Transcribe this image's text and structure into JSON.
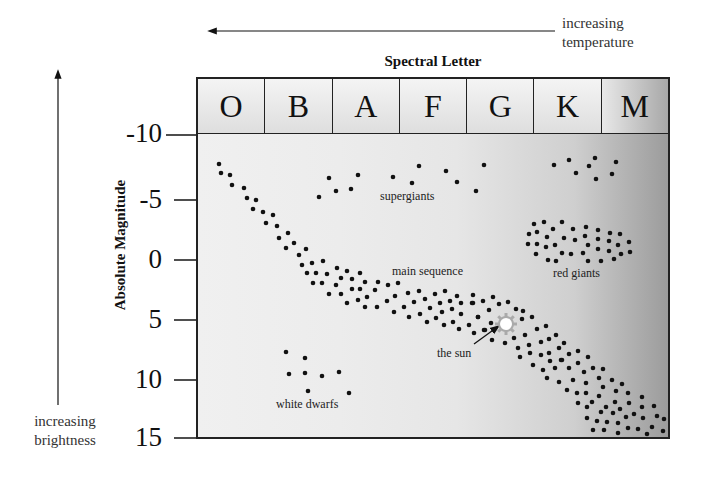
{
  "chart_data": {
    "type": "scatter",
    "xlabel": "Spectral Letter",
    "ylabel": "Absolute Magnitude",
    "x_categories": [
      "O",
      "B",
      "A",
      "F",
      "G",
      "K",
      "M"
    ],
    "y_ticks": [
      "-10",
      "-5",
      "0",
      "5",
      "10",
      "15"
    ],
    "y_tick_values": [
      -10,
      -5,
      0,
      5,
      10,
      15
    ],
    "ylim": [
      -10,
      15
    ],
    "y_inverted": true,
    "grid": false,
    "annotations": {
      "x_direction": "increasing temperature",
      "y_direction": "increasing brightness",
      "regions": [
        "supergiants",
        "red giants",
        "main sequence",
        "white dwarfs",
        "the sun"
      ]
    },
    "groups": [
      {
        "name": "supergiants",
        "points_px": [
          [
            319,
            197
          ],
          [
            329,
            178
          ],
          [
            336,
            191
          ],
          [
            351,
            189
          ],
          [
            358,
            175
          ],
          [
            393,
            177
          ],
          [
            412,
            183
          ],
          [
            419,
            166
          ],
          [
            446,
            171
          ],
          [
            457,
            182
          ],
          [
            476,
            191
          ],
          [
            484,
            165
          ],
          [
            554,
            165
          ],
          [
            569,
            160
          ],
          [
            576,
            173
          ],
          [
            589,
            166
          ],
          [
            595,
            158
          ],
          [
            596,
            179
          ],
          [
            612,
            174
          ],
          [
            616,
            162
          ]
        ]
      },
      {
        "name": "red giants",
        "points_px": [
          [
            534,
            224
          ],
          [
            544,
            222
          ],
          [
            562,
            222
          ],
          [
            553,
            229
          ],
          [
            529,
            234
          ],
          [
            537,
            232
          ],
          [
            547,
            237
          ],
          [
            573,
            229
          ],
          [
            586,
            227
          ],
          [
            598,
            230
          ],
          [
            610,
            233
          ],
          [
            620,
            234
          ],
          [
            564,
            238
          ],
          [
            575,
            240
          ],
          [
            585,
            236
          ],
          [
            598,
            239
          ],
          [
            609,
            241
          ],
          [
            629,
            242
          ],
          [
            528,
            244
          ],
          [
            537,
            244
          ],
          [
            546,
            247
          ],
          [
            555,
            245
          ],
          [
            588,
            245
          ],
          [
            598,
            249
          ],
          [
            609,
            251
          ],
          [
            618,
            245
          ],
          [
            630,
            252
          ],
          [
            536,
            254
          ],
          [
            562,
            253
          ],
          [
            571,
            254
          ],
          [
            583,
            253
          ],
          [
            621,
            254
          ],
          [
            548,
            260
          ],
          [
            556,
            261
          ],
          [
            588,
            261
          ],
          [
            601,
            261
          ],
          [
            614,
            259
          ]
        ]
      },
      {
        "name": "main sequence",
        "points_px": [
          [
            219,
            164
          ],
          [
            221,
            173
          ],
          [
            230,
            175
          ],
          [
            232,
            185
          ],
          [
            244,
            188
          ],
          [
            247,
            198
          ],
          [
            256,
            200
          ],
          [
            253,
            209
          ],
          [
            263,
            212
          ],
          [
            273,
            215
          ],
          [
            266,
            223
          ],
          [
            277,
            226
          ],
          [
            288,
            233
          ],
          [
            279,
            238
          ],
          [
            294,
            243
          ],
          [
            286,
            248
          ],
          [
            306,
            249
          ],
          [
            299,
            255
          ],
          [
            302,
            265
          ],
          [
            312,
            263
          ],
          [
            323,
            261
          ],
          [
            307,
            273
          ],
          [
            316,
            273
          ],
          [
            327,
            274
          ],
          [
            337,
            268
          ],
          [
            347,
            271
          ],
          [
            360,
            273
          ],
          [
            313,
            283
          ],
          [
            322,
            283
          ],
          [
            336,
            285
          ],
          [
            341,
            278
          ],
          [
            352,
            279
          ],
          [
            365,
            282
          ],
          [
            378,
            282
          ],
          [
            388,
            285
          ],
          [
            398,
            283
          ],
          [
            329,
            294
          ],
          [
            341,
            294
          ],
          [
            352,
            289
          ],
          [
            360,
            289
          ],
          [
            375,
            290
          ],
          [
            367,
            297
          ],
          [
            358,
            300
          ],
          [
            347,
            303
          ],
          [
            365,
            307
          ],
          [
            377,
            307
          ],
          [
            387,
            301
          ],
          [
            395,
            296
          ],
          [
            408,
            293
          ],
          [
            419,
            291
          ],
          [
            435,
            294
          ],
          [
            445,
            291
          ],
          [
            457,
            296
          ],
          [
            473,
            295
          ],
          [
            483,
            301
          ],
          [
            394,
            312
          ],
          [
            404,
            307
          ],
          [
            414,
            302
          ],
          [
            425,
            299
          ],
          [
            440,
            303
          ],
          [
            450,
            301
          ],
          [
            461,
            303
          ],
          [
            472,
            303
          ],
          [
            409,
            317
          ],
          [
            420,
            314
          ],
          [
            430,
            308
          ],
          [
            442,
            312
          ],
          [
            452,
            309
          ],
          [
            461,
            314
          ],
          [
            427,
            322
          ],
          [
            436,
            318
          ],
          [
            444,
            325
          ],
          [
            453,
            322
          ],
          [
            459,
            329
          ],
          [
            469,
            325
          ],
          [
            478,
            317
          ],
          [
            474,
            333
          ],
          [
            484,
            330
          ],
          [
            493,
            297
          ],
          [
            473,
            303
          ],
          [
            499,
            304
          ],
          [
            508,
            302
          ],
          [
            516,
            309
          ],
          [
            489,
            310
          ],
          [
            478,
            317
          ],
          [
            523,
            311
          ],
          [
            522,
            319
          ],
          [
            532,
            317
          ],
          [
            491,
            323
          ],
          [
            485,
            330
          ],
          [
            492,
            340
          ],
          [
            505,
            343
          ],
          [
            514,
            338
          ],
          [
            525,
            335
          ],
          [
            537,
            329
          ],
          [
            546,
            326
          ],
          [
            518,
            348
          ],
          [
            529,
            345
          ],
          [
            541,
            342
          ],
          [
            549,
            339
          ],
          [
            556,
            335
          ],
          [
            520,
            357
          ],
          [
            530,
            353
          ],
          [
            541,
            355
          ],
          [
            549,
            353
          ],
          [
            559,
            348
          ],
          [
            564,
            343
          ],
          [
            533,
            365
          ],
          [
            543,
            370
          ],
          [
            550,
            361
          ],
          [
            561,
            360
          ],
          [
            569,
            354
          ],
          [
            578,
            351
          ],
          [
            588,
            357
          ],
          [
            562,
            360
          ],
          [
            578,
            363
          ],
          [
            555,
            368
          ],
          [
            569,
            368
          ],
          [
            584,
            372
          ],
          [
            593,
            368
          ],
          [
            603,
            369
          ],
          [
            547,
            378
          ],
          [
            559,
            382
          ],
          [
            573,
            380
          ],
          [
            586,
            383
          ],
          [
            599,
            378
          ],
          [
            612,
            380
          ],
          [
            622,
            384
          ],
          [
            567,
            390
          ],
          [
            577,
            393
          ],
          [
            586,
            393
          ],
          [
            603,
            387
          ],
          [
            616,
            391
          ],
          [
            628,
            393
          ],
          [
            642,
            397
          ],
          [
            578,
            403
          ],
          [
            592,
            402
          ],
          [
            599,
            396
          ],
          [
            615,
            402
          ],
          [
            629,
            403
          ],
          [
            587,
            407
          ],
          [
            606,
            407
          ],
          [
            620,
            409
          ],
          [
            642,
            407
          ],
          [
            654,
            406
          ],
          [
            601,
            412
          ],
          [
            613,
            413
          ],
          [
            634,
            414
          ],
          [
            657,
            416
          ],
          [
            587,
            418
          ],
          [
            597,
            421
          ],
          [
            607,
            422
          ],
          [
            618,
            423
          ],
          [
            626,
            417
          ],
          [
            643,
            418
          ],
          [
            664,
            419
          ],
          [
            593,
            430
          ],
          [
            604,
            430
          ],
          [
            618,
            433
          ],
          [
            628,
            428
          ],
          [
            638,
            429
          ],
          [
            652,
            427
          ],
          [
            663,
            431
          ],
          [
            647,
            434
          ]
        ]
      },
      {
        "name": "white dwarfs",
        "points_px": [
          [
            286,
            352
          ],
          [
            305,
            358
          ],
          [
            289,
            374
          ],
          [
            305,
            373
          ],
          [
            322,
            376
          ],
          [
            339,
            372
          ],
          [
            308,
            391
          ],
          [
            349,
            393
          ]
        ]
      },
      {
        "name": "the sun",
        "points_px": [
          [
            506,
            324
          ]
        ],
        "spectral_class": "G",
        "approx_magnitude": 5
      }
    ]
  },
  "header": {
    "temperature_label_line1": "increasing",
    "temperature_label_line2": "temperature",
    "spectral_title": "Spectral Letter",
    "spectral_letters": [
      "O",
      "B",
      "A",
      "F",
      "G",
      "K",
      "M"
    ]
  },
  "axis": {
    "y_title": "Absolute Magnitude",
    "brightness_label_line1": "increasing",
    "brightness_label_line2": "brightness",
    "y_ticks": [
      "-10",
      "-5",
      "0",
      "5",
      "10",
      "15"
    ]
  },
  "labels": {
    "supergiants": "supergiants",
    "main_sequence": "main sequence",
    "red_giants": "red giants",
    "the_sun": "the sun",
    "white_dwarfs": "white dwarfs"
  },
  "colors": {
    "dot": "#111111",
    "sun_fill": "#ffffff",
    "sun_rays": "#aaaaaa",
    "frame": "#222222"
  }
}
